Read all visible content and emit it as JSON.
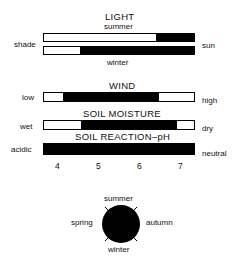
{
  "light": {
    "title": "LIGHT",
    "top_label": "summer",
    "bottom_label": "winter",
    "left_label": "shade",
    "right_label": "sun"
  },
  "wind": {
    "title": "WIND",
    "left_label": "low",
    "right_label": "high"
  },
  "soil_moisture": {
    "title": "SOIL MOISTURE",
    "left_label": "wet",
    "right_label": "dry"
  },
  "soil_reaction": {
    "title": "SOIL REACTION–pH",
    "left_label": "acidic",
    "right_label": "neutral",
    "ticks": [
      "4",
      "5",
      "6",
      "7"
    ]
  },
  "seasons": {
    "top": "summer",
    "right": "autumn",
    "bottom": "winter",
    "left": "spring"
  },
  "colors": {
    "fill": "#000000",
    "background": "#ffffff"
  }
}
